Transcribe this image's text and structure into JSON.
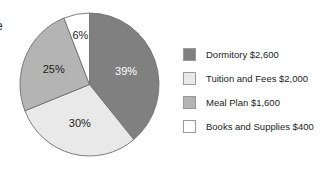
{
  "edge_artifact": {
    "text": "e"
  },
  "chart_data": {
    "type": "pie",
    "title": "",
    "subtitle": "",
    "xlabel": "",
    "ylabel": "",
    "grid": false,
    "legend_position": "right",
    "start_angle_deg": 0,
    "direction": "clockwise",
    "categories": [
      "Dormitory",
      "Tuition and Fees",
      "Meal Plan",
      "Books and Supplies"
    ],
    "values": [
      39,
      30,
      25,
      6
    ],
    "value_unit": "percent",
    "amounts": [
      2600,
      2000,
      1600,
      400
    ],
    "slice_labels": [
      "39%",
      "30%",
      "25%",
      "6%"
    ],
    "colors": [
      "#808080",
      "#e9e9e9",
      "#b4b4b4",
      "#ffffff"
    ],
    "label_colors": [
      "#ffffff",
      "#1d1d1d",
      "#1d1d1d",
      "#1d1d1d"
    ],
    "slices": [
      {
        "name": "Dormitory",
        "percent_label": "39%",
        "percent": 39,
        "amount_label": "$2,600",
        "color": "#808080",
        "label_color": "#ffffff",
        "legend_label": "Dormitory $2,600"
      },
      {
        "name": "Tuition and Fees",
        "percent_label": "30%",
        "percent": 30,
        "amount_label": "$2,000",
        "color": "#e9e9e9",
        "label_color": "#1d1d1d",
        "legend_label": "Tuition and Fees $2,000"
      },
      {
        "name": "Meal Plan",
        "percent_label": "25%",
        "percent": 25,
        "amount_label": "$1,600",
        "color": "#b4b4b4",
        "label_color": "#1d1d1d",
        "legend_label": "Meal Plan $1,600"
      },
      {
        "name": "Books and Supplies",
        "percent_label": "6%",
        "percent": 6,
        "amount_label": "$400",
        "color": "#ffffff",
        "label_color": "#1d1d1d",
        "legend_label": "Books and Supplies $400"
      }
    ]
  },
  "legend": {
    "items": [
      {
        "label": "Dormitory $2,600",
        "color": "#808080"
      },
      {
        "label": "Tuition and Fees $2,000",
        "color": "#e9e9e9"
      },
      {
        "label": "Meal Plan $1,600",
        "color": "#b4b4b4"
      },
      {
        "label": "Books and Supplies $400",
        "color": "#ffffff"
      }
    ]
  }
}
